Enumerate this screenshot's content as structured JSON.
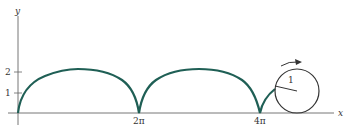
{
  "diagram": {
    "axes": {
      "x_label": "x",
      "y_label": "y",
      "y_ticks": [
        "1",
        "2"
      ],
      "x_ticks": [
        "2π",
        "4π"
      ]
    },
    "circle": {
      "radius_label": "1",
      "rotation_arrow": "clockwise arrow"
    },
    "colors": {
      "curve": "#1f5f55",
      "axes": "#555555",
      "circle": "#333333"
    }
  }
}
